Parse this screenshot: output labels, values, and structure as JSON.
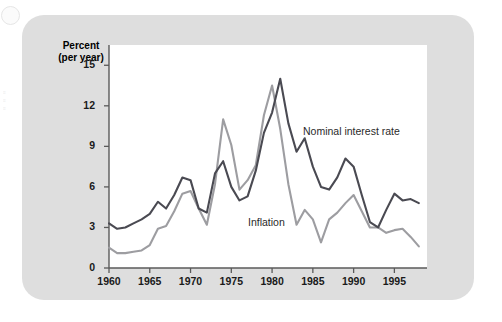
{
  "figure": {
    "axis_title_line1": "Percent",
    "axis_title_line2": "(per year)",
    "series_label_nominal": "Nominal interest rate",
    "series_label_inflation": "Inflation",
    "color_nominal": "#4a4a52",
    "color_inflation": "#9d9da1",
    "color_card": "#dedede",
    "color_panel": "#ffffff",
    "color_axis": "#5a5a5a"
  },
  "chart_data": {
    "type": "line",
    "title": "",
    "xlabel": "",
    "ylabel": "Percent (per year)",
    "xlim": [
      1960,
      1999
    ],
    "ylim": [
      0,
      16.5
    ],
    "yticks": [
      0,
      3,
      6,
      9,
      12,
      15
    ],
    "xticks": [
      1960,
      1965,
      1970,
      1975,
      1980,
      1985,
      1990,
      1995
    ],
    "grid": false,
    "legend": "inline-annotation",
    "x": [
      1960,
      1961,
      1962,
      1963,
      1964,
      1965,
      1966,
      1967,
      1968,
      1969,
      1970,
      1971,
      1972,
      1973,
      1974,
      1975,
      1976,
      1977,
      1978,
      1979,
      1980,
      1981,
      1982,
      1983,
      1984,
      1985,
      1986,
      1987,
      1988,
      1989,
      1990,
      1991,
      1992,
      1993,
      1994,
      1995,
      1996,
      1997,
      1998
    ],
    "series": [
      {
        "name": "Nominal interest rate",
        "values": [
          3.3,
          2.9,
          3.0,
          3.3,
          3.6,
          4.0,
          4.9,
          4.4,
          5.4,
          6.7,
          6.5,
          4.4,
          4.1,
          7.0,
          7.9,
          6.0,
          5.0,
          5.3,
          7.2,
          10.0,
          11.5,
          14.0,
          10.7,
          8.6,
          9.6,
          7.5,
          6.0,
          5.8,
          6.7,
          8.1,
          7.5,
          5.4,
          3.4,
          3.0,
          4.3,
          5.5,
          5.0,
          5.1,
          4.8
        ],
        "color": "#4a4a52"
      },
      {
        "name": "Inflation",
        "values": [
          1.5,
          1.1,
          1.1,
          1.2,
          1.3,
          1.7,
          2.9,
          3.1,
          4.2,
          5.5,
          5.7,
          4.4,
          3.2,
          6.2,
          11.0,
          9.1,
          5.8,
          6.5,
          7.6,
          11.3,
          13.5,
          10.3,
          6.2,
          3.2,
          4.3,
          3.6,
          1.9,
          3.6,
          4.1,
          4.8,
          5.4,
          4.2,
          3.0,
          3.0,
          2.6,
          2.8,
          2.9,
          2.3,
          1.6
        ],
        "color": "#9d9da1"
      }
    ],
    "annotations": [
      {
        "text": "Nominal interest rate",
        "x": 1984.0,
        "y": 10.0
      },
      {
        "text": "Inflation",
        "x": 1976.8,
        "y": 4.0
      }
    ]
  }
}
